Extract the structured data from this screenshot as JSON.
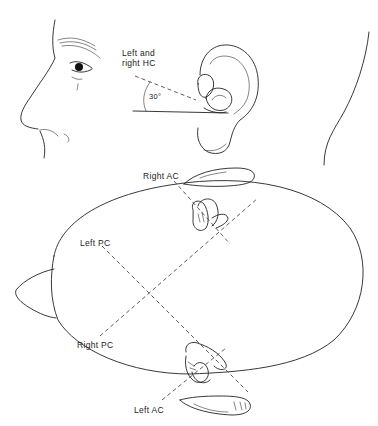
{
  "figure": {
    "side_view": {
      "label_hc_line1": "Left and",
      "label_hc_line2": "right HC",
      "angle_label": "30°"
    },
    "top_view": {
      "label_right_ac": "Right AC",
      "label_left_pc": "Left PC",
      "label_right_pc": "Right PC",
      "label_left_ac": "Left AC"
    },
    "colors": {
      "line": "#222222",
      "background": "#ffffff"
    }
  }
}
